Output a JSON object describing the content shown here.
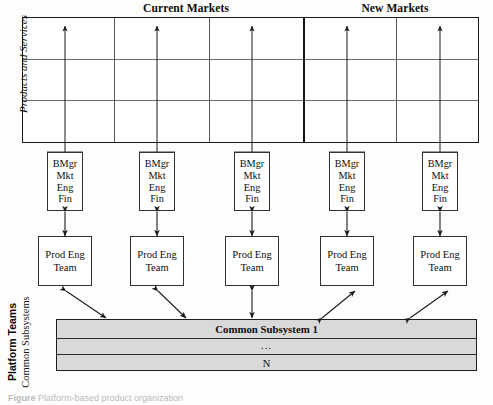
{
  "figure": {
    "headings": [
      {
        "label": "Current Markets",
        "center_x": 186,
        "top": 2
      },
      {
        "label": "New Markets",
        "center_x": 395,
        "top": 2
      }
    ],
    "matrix": {
      "axis_label": "Products and Services",
      "columns": 5,
      "rows": 3,
      "market_divider_after_column": 3
    },
    "columns": [
      {
        "id": "col-1",
        "market": "Current Markets",
        "business_unit": {
          "lines": [
            "BMgr",
            "Mkt",
            "Eng",
            "Fin"
          ]
        },
        "product_team": {
          "lines": [
            "Prod Eng",
            "Team"
          ]
        },
        "platform_link": "diagonal-down-right"
      },
      {
        "id": "col-2",
        "market": "Current Markets",
        "business_unit": {
          "lines": [
            "BMgr",
            "Mkt",
            "Eng",
            "Fin"
          ]
        },
        "product_team": {
          "lines": [
            "Prod Eng",
            "Team"
          ]
        },
        "platform_link": "diagonal-down-right"
      },
      {
        "id": "col-3",
        "market": "Current Markets",
        "business_unit": {
          "lines": [
            "BMgr",
            "Mkt",
            "Eng",
            "Fin"
          ]
        },
        "product_team": {
          "lines": [
            "Prod Eng",
            "Team"
          ]
        },
        "platform_link": "vertical"
      },
      {
        "id": "col-4",
        "market": "New Markets",
        "business_unit": {
          "lines": [
            "BMgr",
            "Mkt",
            "Eng",
            "Fin"
          ]
        },
        "product_team": {
          "lines": [
            "Prod Eng",
            "Team"
          ]
        },
        "platform_link": "diagonal-up-right"
      },
      {
        "id": "col-5",
        "market": "New Markets",
        "business_unit": {
          "lines": [
            "BMgr",
            "Mkt",
            "Eng",
            "Fin"
          ]
        },
        "product_team": {
          "lines": [
            "Prod Eng",
            "Team"
          ]
        },
        "platform_link": "diagonal-up-right"
      }
    ],
    "platform": {
      "label_bold": "Platform Teams",
      "label_regular": "Common Subsystems",
      "bands": [
        {
          "text": "Common Subsystem 1",
          "bold": true
        },
        {
          "text": "...",
          "bold": false
        },
        {
          "text": "N",
          "bold": false
        }
      ]
    },
    "caption": {
      "prefix": "Figure",
      "text": "Platform-based product organization"
    },
    "colors": {
      "outline": "#1a1a1a",
      "grid_line": "#6a6a70",
      "box_border": "#303036",
      "platform_fill": "#d9d9d9",
      "page_background": "#ffffff",
      "text": "#111111"
    }
  }
}
